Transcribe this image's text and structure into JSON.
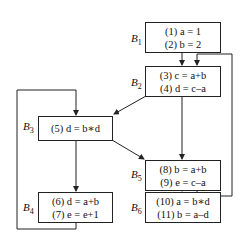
{
  "diagram": {
    "type": "control-flow-graph",
    "blocks": [
      {
        "id": "B1",
        "label_main": "B",
        "label_sub": "1",
        "statements": [
          "(1) a = 1",
          "(2) b = 2"
        ]
      },
      {
        "id": "B2",
        "label_main": "B",
        "label_sub": "2",
        "statements": [
          "(3) c = a+b",
          "(4) d = c–a"
        ]
      },
      {
        "id": "B3",
        "label_main": "B",
        "label_sub": "3",
        "statements": [
          "(5) d = b∗d"
        ]
      },
      {
        "id": "B4",
        "label_main": "B",
        "label_sub": "4",
        "statements": [
          "(6) d = a+b",
          "(7) e = e+1"
        ]
      },
      {
        "id": "B5",
        "label_main": "B",
        "label_sub": "5",
        "statements": [
          "(8) b = a+b",
          "(9) e = c–a"
        ]
      },
      {
        "id": "B6",
        "label_main": "B",
        "label_sub": "6",
        "statements": [
          "(10) a = b∗d",
          "(11) b = a–d"
        ]
      }
    ],
    "edges": [
      {
        "from": "B1",
        "to": "B2"
      },
      {
        "from": "B2",
        "to": "B3"
      },
      {
        "from": "B2",
        "to": "B5"
      },
      {
        "from": "B3",
        "to": "B4"
      },
      {
        "from": "B3",
        "to": "B5"
      },
      {
        "from": "B4",
        "to": "B3"
      },
      {
        "from": "B5",
        "to": "B2"
      },
      {
        "from": "B5",
        "to": "B6"
      }
    ],
    "colors": {
      "line": "#222222",
      "background": "#ffffff"
    }
  }
}
